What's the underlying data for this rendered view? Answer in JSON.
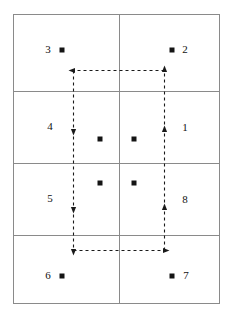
{
  "figure": {
    "title": "",
    "frame": {
      "x": 13,
      "y": 14,
      "width": 206,
      "height": 289,
      "stroke": "#8a8a8a",
      "stroke_width": 1
    },
    "grid": {
      "vertical_lines": [
        {
          "x": 119,
          "y1": 14,
          "y2": 303
        }
      ],
      "horizontal_lines": [
        {
          "y": 91,
          "x1": 13,
          "x2": 219
        },
        {
          "y": 163,
          "x1": 13,
          "x2": 219
        },
        {
          "y": 235,
          "x1": 13,
          "x2": 219
        }
      ],
      "rows": 4,
      "columns": 2,
      "stroke": "#8a8a8a"
    },
    "region_labels": [
      {
        "text": "3",
        "x": 48,
        "y": 49
      },
      {
        "text": "2",
        "x": 185,
        "y": 49
      },
      {
        "text": "4",
        "x": 50,
        "y": 126
      },
      {
        "text": "1",
        "x": 185,
        "y": 127
      },
      {
        "text": "5",
        "x": 50,
        "y": 198
      },
      {
        "text": "8",
        "x": 185,
        "y": 199
      },
      {
        "text": "6",
        "x": 48,
        "y": 275
      },
      {
        "text": "7",
        "x": 186,
        "y": 275
      }
    ],
    "node_markers": [
      {
        "x": 62,
        "y": 50,
        "size": 5
      },
      {
        "x": 172,
        "y": 50,
        "size": 5
      },
      {
        "x": 100,
        "y": 139,
        "size": 5
      },
      {
        "x": 134,
        "y": 139,
        "size": 5
      },
      {
        "x": 100,
        "y": 183,
        "size": 5
      },
      {
        "x": 134,
        "y": 183,
        "size": 5
      },
      {
        "x": 62,
        "y": 276,
        "size": 5
      },
      {
        "x": 172,
        "y": 276,
        "size": 5
      }
    ],
    "dashed_path": {
      "color": "#1a1a1a",
      "stroke_width": 1.1,
      "dash_pattern": "3,3",
      "left_x": 73,
      "right_x": 164,
      "top_y": 70,
      "bottom_y": 250,
      "segments": [
        {
          "name": "top-horizontal",
          "x1": 164,
          "y1": 70,
          "x2": 73,
          "y2": 70,
          "direction": "leftward"
        },
        {
          "name": "left-vertical",
          "x1": 73,
          "y1": 70,
          "x2": 73,
          "y2": 250,
          "direction": "downward"
        },
        {
          "name": "bottom-horizontal",
          "x1": 73,
          "y1": 250,
          "x2": 164,
          "y2": 250,
          "direction": "rightward"
        },
        {
          "name": "right-vertical",
          "x1": 164,
          "y1": 250,
          "x2": 164,
          "y2": 70,
          "direction": "upward"
        }
      ],
      "arrowheads": [
        {
          "name": "top-left-arrow",
          "x": 73,
          "y": 70,
          "points": "left"
        },
        {
          "name": "left-upper-arrow",
          "x": 73,
          "y": 130,
          "points": "down"
        },
        {
          "name": "left-lower-arrow",
          "x": 73,
          "y": 208,
          "points": "down"
        },
        {
          "name": "left-bottom-arrow",
          "x": 73,
          "y": 250,
          "points": "down"
        },
        {
          "name": "bottom-right-arrow",
          "x": 164,
          "y": 250,
          "points": "right"
        },
        {
          "name": "right-lower-arrow",
          "x": 164,
          "y": 208,
          "points": "up"
        },
        {
          "name": "right-upper-arrow",
          "x": 164,
          "y": 130,
          "points": "up"
        },
        {
          "name": "top-right-arrow",
          "x": 164,
          "y": 70,
          "points": "up"
        }
      ]
    }
  }
}
